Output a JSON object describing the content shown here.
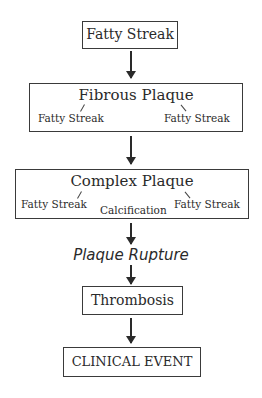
{
  "diagram": {
    "nodes": {
      "fatty_streak": {
        "label": "Fatty Streak"
      },
      "fibrous_plaque": {
        "label": "Fibrous Plaque",
        "sub_left": "Fatty Streak",
        "sub_right": "Fatty Streak"
      },
      "complex_plaque": {
        "label": "Complex Plaque",
        "sub_left": "Fatty Streak",
        "sub_center": "Calcification",
        "sub_right": "Fatty Streak"
      },
      "plaque_rupture": {
        "label": "Plaque Rupture"
      },
      "thrombosis": {
        "label": "Thrombosis"
      },
      "clinical_event": {
        "label": "CLINICAL EVENT"
      }
    },
    "edges": [
      [
        "Fatty Streak",
        "Fibrous Plaque"
      ],
      [
        "Fibrous Plaque",
        "Complex Plaque"
      ],
      [
        "Complex Plaque",
        "Plaque Rupture"
      ],
      [
        "Plaque Rupture",
        "Thrombosis"
      ],
      [
        "Thrombosis",
        "CLINICAL EVENT"
      ]
    ]
  }
}
